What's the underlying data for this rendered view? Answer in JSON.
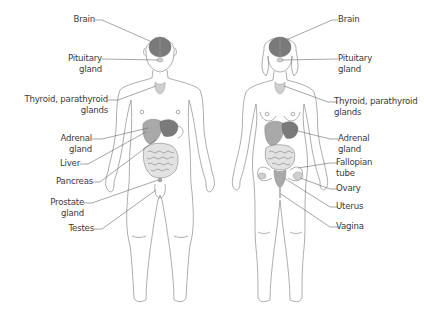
{
  "figures": {
    "male": {
      "labels": [
        {
          "id": "brain",
          "lines": [
            "Brain"
          ]
        },
        {
          "id": "pituitary",
          "lines": [
            "Pituitary",
            "gland"
          ]
        },
        {
          "id": "thyroid",
          "lines": [
            "Thyroid, parathyroid",
            "glands"
          ]
        },
        {
          "id": "adrenal",
          "lines": [
            "Adrenal",
            "gland"
          ]
        },
        {
          "id": "liver",
          "lines": [
            "Liver"
          ]
        },
        {
          "id": "pancreas",
          "lines": [
            "Pancreas"
          ]
        },
        {
          "id": "prostate",
          "lines": [
            "Prostate",
            "gland"
          ]
        },
        {
          "id": "testes",
          "lines": [
            "Testes"
          ]
        }
      ]
    },
    "female": {
      "labels": [
        {
          "id": "brain",
          "lines": [
            "Brain"
          ]
        },
        {
          "id": "pituitary",
          "lines": [
            "Pituitary",
            "gland"
          ]
        },
        {
          "id": "thyroid",
          "lines": [
            "Thyroid, parathyroid",
            "glands"
          ]
        },
        {
          "id": "adrenal",
          "lines": [
            "Adrenal",
            "gland"
          ]
        },
        {
          "id": "fallopian",
          "lines": [
            "Fallopian",
            "tube"
          ]
        },
        {
          "id": "ovary",
          "lines": [
            "Ovary"
          ]
        },
        {
          "id": "uterus",
          "lines": [
            "Uterus"
          ]
        },
        {
          "id": "vagina",
          "lines": [
            "Vagina"
          ]
        }
      ]
    }
  },
  "colors": {
    "outline": "#8a8a8a",
    "organ_dark": "#7a7a7a",
    "text": "#3a3a3a",
    "background": "#ffffff"
  }
}
